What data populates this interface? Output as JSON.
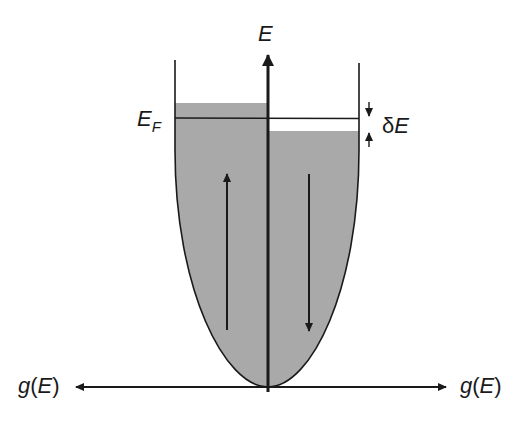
{
  "diagram": {
    "labels": {
      "energy_axis": "E",
      "fermi_level": "E",
      "fermi_level_sub": "F",
      "energy_shift_delta": "δ",
      "energy_shift_E": "E",
      "left_axis_g": "g",
      "left_axis_paren_open": "(",
      "left_axis_E": "E",
      "left_axis_paren_close": ")",
      "right_axis_g": "g",
      "right_axis_paren_open": "(",
      "right_axis_E": "E",
      "right_axis_paren_close": ")"
    },
    "bands": {
      "spin_up": {
        "side": "left",
        "arrow": "up",
        "fill_level": "above E_F"
      },
      "spin_down": {
        "side": "right",
        "arrow": "down",
        "fill_level": "below E_F"
      }
    },
    "colors": {
      "fill": "#a9a9a9",
      "line": "#1a1a1a",
      "background": "#ffffff"
    }
  }
}
